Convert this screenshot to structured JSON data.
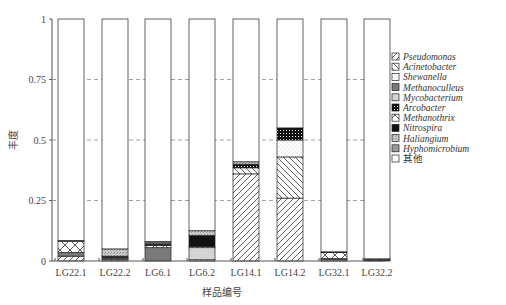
{
  "chart_data": {
    "type": "bar",
    "stacked": true,
    "title": "",
    "xlabel": "样品编号",
    "ylabel": "丰度",
    "ylim": [
      0,
      1
    ],
    "yticks": [
      "0",
      "0.25",
      "0.5",
      "0.75",
      "1"
    ],
    "grid": "dashed horizontal at 0.25, 0.5, 0.75",
    "legend_position": "right",
    "categories": [
      "LG22.1",
      "LG22.2",
      "LG6.1",
      "LG6.2",
      "LG14.1",
      "LG14.2",
      "LG32.1",
      "LG32.2"
    ],
    "series": [
      {
        "name": "Pseudomonas",
        "pattern": "diag-right",
        "values": [
          0.02,
          0.005,
          0.0,
          0.005,
          0.36,
          0.26,
          0.005,
          0.003
        ]
      },
      {
        "name": "Acinetobacter",
        "pattern": "diag-left",
        "values": [
          0.0,
          0.0,
          0.0,
          0.0,
          0.025,
          0.17,
          0.0,
          0.0
        ]
      },
      {
        "name": "Shewanella",
        "pattern": "dots",
        "values": [
          0.0,
          0.0,
          0.0,
          0.0,
          0.0,
          0.07,
          0.0,
          0.0
        ]
      },
      {
        "name": "Methanoculleus",
        "pattern": "dark-gray",
        "values": [
          0.015,
          0.005,
          0.055,
          0.0,
          0.0,
          0.0,
          0.005,
          0.003
        ]
      },
      {
        "name": "Mycobacterium",
        "pattern": "light-gray",
        "values": [
          0.0,
          0.0,
          0.0,
          0.05,
          0.0,
          0.0,
          0.0,
          0.0
        ]
      },
      {
        "name": "Arcobacter",
        "pattern": "grid-dots",
        "values": [
          0.0,
          0.0,
          0.0,
          0.0,
          0.015,
          0.05,
          0.0,
          0.0
        ]
      },
      {
        "name": "Methanothrix",
        "pattern": "cross",
        "values": [
          0.045,
          0.005,
          0.01,
          0.005,
          0.0,
          0.0,
          0.025,
          0.003
        ]
      },
      {
        "name": "Nitrospira",
        "pattern": "black",
        "values": [
          0.0,
          0.005,
          0.005,
          0.045,
          0.0,
          0.0,
          0.003,
          0.0
        ]
      },
      {
        "name": "Haliangium",
        "pattern": "speckle",
        "values": [
          0.005,
          0.03,
          0.005,
          0.02,
          0.01,
          0.0,
          0.0,
          0.0
        ]
      },
      {
        "name": "Hyphomicrobium",
        "pattern": "mid-gray",
        "values": [
          0.0,
          0.0,
          0.005,
          0.0,
          0.0,
          0.0,
          0.0,
          0.0
        ]
      },
      {
        "name": "其他",
        "pattern": "white",
        "values": [
          0.915,
          0.95,
          0.92,
          0.875,
          0.59,
          0.45,
          0.962,
          0.991
        ]
      }
    ]
  },
  "legend": {
    "items": [
      "Pseudomonas",
      "Acinetobacter",
      "Shewanella",
      "Methanoculleus",
      "Mycobacterium",
      "Arcobacter",
      "Methanothrix",
      "Nitrospira",
      "Haliangium",
      "Hyphomicrobium",
      "其他"
    ]
  },
  "axes": {
    "xlabel": "样品编号",
    "ylabel": "丰度"
  }
}
